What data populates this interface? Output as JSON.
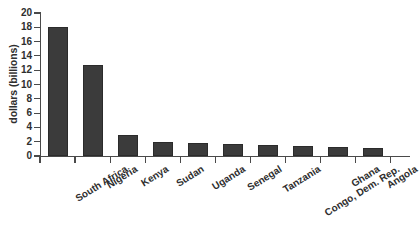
{
  "chart_data": {
    "type": "bar",
    "title": "",
    "subtitle": "",
    "xlabel": "",
    "ylabel": "dollars (billions)",
    "ylim": [
      0,
      20
    ],
    "ytick_step": 2,
    "yticks": [
      "20",
      "18",
      "16",
      "14",
      "12",
      "10",
      "8",
      "6",
      "4",
      "2",
      "0"
    ],
    "grid": false,
    "legend": null,
    "categories": [
      "South Africa",
      "Nigeria",
      "Kenya",
      "Sudan",
      "Uganda",
      "Senegal",
      "Tanzania",
      "Congo, Dem. Rep.",
      "Ghana",
      "Angola"
    ],
    "values": [
      18.1,
      12.7,
      3.0,
      1.9,
      1.75,
      1.7,
      1.5,
      1.35,
      1.25,
      1.15
    ],
    "bar_color": "#3b3b3b",
    "axis_color": "#4a4a4a",
    "text_color": "#2e2e2e",
    "background": "#ffffff"
  }
}
